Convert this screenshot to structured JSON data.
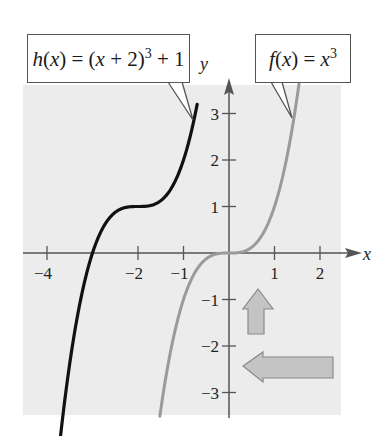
{
  "chart_data": {
    "type": "line",
    "title": "",
    "xlabel": "x",
    "ylabel": "y",
    "xlim": [
      -4.5,
      2.5
    ],
    "ylim": [
      -3.5,
      3.6
    ],
    "grid": false,
    "x_ticks": [
      -4,
      -2,
      -1,
      1,
      2
    ],
    "x_tick_labels": [
      "−4",
      "−2",
      "−1",
      "1",
      "2"
    ],
    "y_ticks": [
      3,
      2,
      1,
      -1,
      -2,
      -3
    ],
    "y_tick_labels": [
      "3",
      "2",
      "1",
      "−1",
      "−2",
      "−3"
    ],
    "series": [
      {
        "name": "h(x) = (x + 2)^3 + 1",
        "color": "#111111",
        "x": [
          -3.7,
          -3.5,
          -3.0,
          -2.5,
          -2.0,
          -1.5,
          -1.0,
          -0.7
        ],
        "y": [
          -3.91,
          -2.38,
          0.0,
          0.88,
          1.0,
          1.13,
          2.0,
          3.2
        ]
      },
      {
        "name": "f(x) = x^3",
        "color": "#9a9a9a",
        "x": [
          -1.52,
          -1.5,
          -1.0,
          -0.5,
          0.0,
          0.5,
          1.0,
          1.5,
          1.55
        ],
        "y": [
          -3.51,
          -3.38,
          -1.0,
          -0.13,
          0.0,
          0.13,
          1.0,
          3.38,
          3.72
        ]
      }
    ],
    "annotations": [
      {
        "type": "callout",
        "text": "h(x) = (x + 2)^3 + 1",
        "points_to": "h curve near (-0.7, 3)"
      },
      {
        "type": "callout",
        "text": "f(x) = x^3",
        "points_to": "f curve near (1.4, 3)"
      },
      {
        "type": "arrow",
        "direction": "up",
        "meaning": "vertical shift up 1 unit"
      },
      {
        "type": "arrow",
        "direction": "left",
        "meaning": "horizontal shift left 2 units"
      }
    ]
  },
  "labels": {
    "h_callout": {
      "func": "h",
      "var": "x",
      "pre": "(",
      "mid": " = (",
      "plus": " + 2)",
      "exp": "3",
      "tail": " + 1"
    },
    "f_callout": {
      "func": "f",
      "var": "x",
      "exp": "3"
    },
    "x_axis": "x",
    "y_axis": "y"
  },
  "colors": {
    "plot_bg": "#ececec",
    "axis": "#555555",
    "h_curve": "#111111",
    "f_curve": "#9a9a9a",
    "arrow_fill": "#c4c4c4",
    "arrow_stroke": "#8a8a8a"
  }
}
